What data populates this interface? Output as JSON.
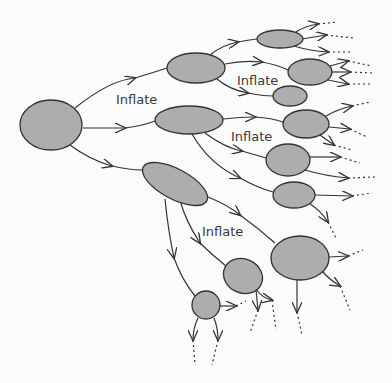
{
  "diagram": {
    "title": "",
    "colors": {
      "background": "#fbfbfb",
      "node_fill": "#adadad",
      "stroke": "#333333"
    },
    "labels": [
      {
        "id": "label-1",
        "text": "Inflate",
        "x": 116,
        "y": 104
      },
      {
        "id": "label-2",
        "text": "Inflate",
        "x": 237,
        "y": 85
      },
      {
        "id": "label-3",
        "text": "Inflate",
        "x": 231,
        "y": 141
      },
      {
        "id": "label-4",
        "text": "Inflate",
        "x": 202,
        "y": 236
      }
    ],
    "nodes": [
      {
        "id": "root",
        "cx": 51,
        "cy": 125,
        "rx": 31,
        "ry": 25,
        "rot": 0
      },
      {
        "id": "a",
        "cx": 196,
        "cy": 68,
        "rx": 29,
        "ry": 15,
        "rot": 0
      },
      {
        "id": "b",
        "cx": 189,
        "cy": 120,
        "rx": 34,
        "ry": 14,
        "rot": 0
      },
      {
        "id": "c",
        "cx": 175,
        "cy": 184,
        "rx": 36,
        "ry": 15,
        "rot": 28
      },
      {
        "id": "a1",
        "cx": 280,
        "cy": 39,
        "rx": 23,
        "ry": 9,
        "rot": 0
      },
      {
        "id": "a2",
        "cx": 310,
        "cy": 72,
        "rx": 22,
        "ry": 13,
        "rot": 0
      },
      {
        "id": "a3",
        "cx": 290,
        "cy": 96,
        "rx": 17,
        "ry": 10,
        "rot": 0
      },
      {
        "id": "b1",
        "cx": 306,
        "cy": 124,
        "rx": 23,
        "ry": 14,
        "rot": 0
      },
      {
        "id": "b2",
        "cx": 288,
        "cy": 160,
        "rx": 22,
        "ry": 16,
        "rot": 0
      },
      {
        "id": "b3",
        "cx": 294,
        "cy": 195,
        "rx": 21,
        "ry": 13,
        "rot": 0
      },
      {
        "id": "c1",
        "cx": 300,
        "cy": 258,
        "rx": 29,
        "ry": 22,
        "rot": 0
      },
      {
        "id": "c2",
        "cx": 243,
        "cy": 276,
        "rx": 20,
        "ry": 17,
        "rot": 25
      },
      {
        "id": "c3",
        "cx": 206,
        "cy": 305,
        "rx": 14,
        "ry": 14,
        "rot": 0
      }
    ],
    "edges": [
      {
        "from": "root",
        "to": "a"
      },
      {
        "from": "root",
        "to": "b"
      },
      {
        "from": "root",
        "to": "c"
      },
      {
        "from": "a",
        "to": "a1"
      },
      {
        "from": "a",
        "to": "a2"
      },
      {
        "from": "a",
        "to": "a3"
      },
      {
        "from": "b",
        "to": "b1"
      },
      {
        "from": "b",
        "to": "b2"
      },
      {
        "from": "b",
        "to": "b3"
      },
      {
        "from": "c",
        "to": "c1"
      },
      {
        "from": "c",
        "to": "c2"
      },
      {
        "from": "c",
        "to": "c3"
      }
    ]
  }
}
